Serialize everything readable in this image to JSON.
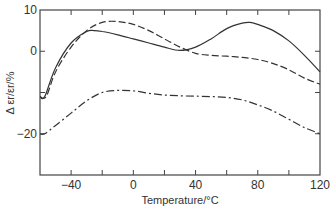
{
  "chart_data": {
    "type": "line",
    "title": "",
    "xlabel": "Temperature/°C",
    "ylabel": "Δ ε_r/ε_r/%",
    "xlim": [
      -60,
      120
    ],
    "ylim": [
      -30,
      10
    ],
    "x_ticks": [
      -40,
      0,
      40,
      80,
      120
    ],
    "x_minor_ticks": [
      -20,
      20,
      60,
      100
    ],
    "y_ticks": [
      10,
      0,
      -20
    ],
    "y_minor_ticks": [
      -10
    ],
    "grid": false,
    "legend": null,
    "series": [
      {
        "name": "solid",
        "style": "solid",
        "x": [
          -60,
          -57,
          -50,
          -40,
          -30,
          -25,
          -20,
          -10,
          0,
          10,
          20,
          30,
          40,
          50,
          60,
          70,
          75,
          80,
          90,
          100,
          110,
          120
        ],
        "y": [
          -11,
          -11,
          -4,
          2,
          4.8,
          5,
          4.8,
          4,
          3,
          2,
          1,
          0.2,
          1,
          3,
          5.5,
          6.8,
          7,
          6.5,
          5,
          2.5,
          -1,
          -5
        ]
      },
      {
        "name": "dashed",
        "style": "dashed",
        "x": [
          -60,
          -56,
          -50,
          -40,
          -30,
          -20,
          -10,
          0,
          10,
          20,
          30,
          40,
          50,
          60,
          70,
          80,
          90,
          100,
          110,
          120
        ],
        "y": [
          -11,
          -11,
          -5,
          1,
          5,
          7,
          7.2,
          6.5,
          5,
          3,
          1,
          -0.5,
          -1,
          -1.2,
          -1.5,
          -2,
          -3,
          -4.5,
          -6.5,
          -8
        ]
      },
      {
        "name": "dash-dot",
        "style": "dashdot",
        "x": [
          -60,
          -57,
          -50,
          -40,
          -30,
          -20,
          -10,
          0,
          10,
          20,
          30,
          40,
          50,
          60,
          70,
          80,
          90,
          100,
          110,
          120
        ],
        "y": [
          -20,
          -20,
          -18,
          -15,
          -12,
          -10,
          -9.5,
          -9.6,
          -10.2,
          -10.6,
          -10.8,
          -10.9,
          -11,
          -11.2,
          -11.8,
          -13,
          -14.5,
          -16.5,
          -18.5,
          -20
        ]
      }
    ]
  },
  "axes": {
    "y_tick_labels": [
      "10",
      "0",
      "−20"
    ],
    "x_tick_labels": [
      "−40",
      "0",
      "40",
      "80",
      "120"
    ],
    "xlabel": "Temperature/°C",
    "ylabel": "Δ εr/εr/%"
  }
}
